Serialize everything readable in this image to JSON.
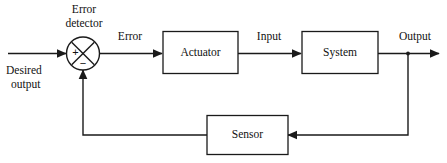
{
  "diagram": {
    "type": "block-diagram",
    "background_color": "#ffffff",
    "line_color": "#1a1a1a",
    "text_color": "#111111",
    "blocks": [
      {
        "id": "actuator",
        "label": "Actuator"
      },
      {
        "id": "system",
        "label": "System"
      },
      {
        "id": "sensor",
        "label": "Sensor"
      }
    ],
    "summing_junction": {
      "id": "error-detector",
      "caption_line1": "Error",
      "caption_line2": "detector",
      "plus_sign": "+",
      "minus_sign": "−"
    },
    "signals": [
      {
        "id": "desired-output",
        "line1": "Desired",
        "line2": "output"
      },
      {
        "id": "error",
        "label": "Error"
      },
      {
        "id": "input",
        "label": "Input"
      },
      {
        "id": "output",
        "label": "Output"
      }
    ]
  }
}
